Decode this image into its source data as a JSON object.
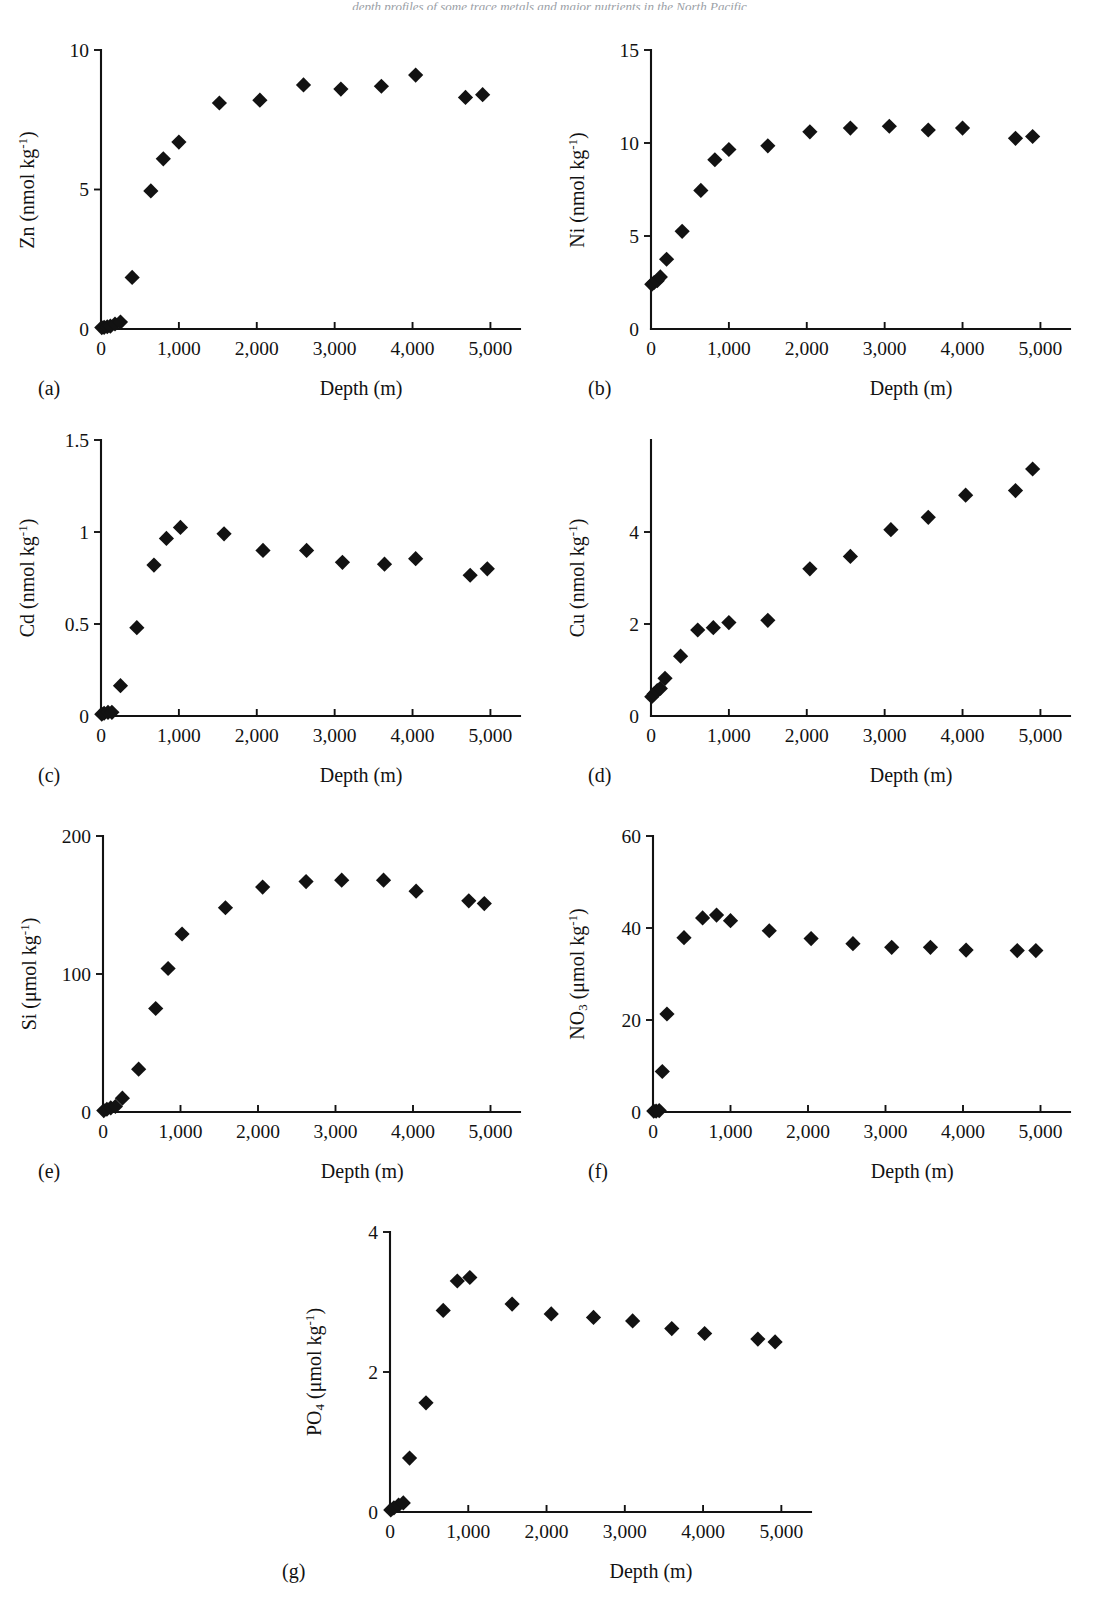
{
  "figure": {
    "page_bleed_text": "depth profiles of some trace metals and major nutrients in the North Pacific",
    "xlabel": "Depth (m)",
    "x_ticks": [
      "0",
      "1,000",
      "2,000",
      "3,000",
      "4,000",
      "5,000"
    ],
    "x_tick_values": [
      0,
      1000,
      2000,
      3000,
      4000,
      5000
    ],
    "marker_style": "filled-diamond",
    "marker_color": "#121212",
    "axis_color": "#121212"
  },
  "chart_data": [
    {
      "type": "scatter",
      "panel": "(a)",
      "title": "",
      "ylabel_plain": "Zn (nmol kg-1)",
      "ylabel_species": "Zn",
      "ylabel_units": "nmol kg",
      "ylabel_exponent": "-1",
      "xlabel": "Depth (m)",
      "xlim": [
        0,
        5200
      ],
      "ylim": [
        0,
        10
      ],
      "y_ticks": [
        "0",
        "5",
        "10"
      ],
      "y_tick_values": [
        0,
        5,
        10
      ],
      "grid": false,
      "legend": "none",
      "x": [
        10,
        40,
        80,
        120,
        180,
        250,
        400,
        640,
        800,
        1000,
        1520,
        2040,
        2600,
        3080,
        3600,
        4040,
        4680,
        4900
      ],
      "y": [
        0.05,
        0.06,
        0.08,
        0.1,
        0.18,
        0.25,
        1.85,
        4.95,
        6.1,
        6.7,
        8.1,
        8.2,
        8.75,
        8.6,
        8.7,
        9.1,
        8.3,
        8.4
      ]
    },
    {
      "type": "scatter",
      "panel": "(b)",
      "title": "",
      "ylabel_plain": "Ni (nmol kg-1)",
      "ylabel_species": "Ni",
      "ylabel_units": "nmol kg",
      "ylabel_exponent": "-1",
      "xlabel": "Depth (m)",
      "xlim": [
        0,
        5200
      ],
      "ylim": [
        0,
        15
      ],
      "y_ticks": [
        "0",
        "5",
        "10",
        "15"
      ],
      "y_tick_values": [
        0,
        5,
        10,
        15
      ],
      "grid": false,
      "legend": "none",
      "x": [
        10,
        40,
        80,
        120,
        200,
        400,
        640,
        820,
        1000,
        1500,
        2040,
        2560,
        3060,
        3560,
        4000,
        4680,
        4900
      ],
      "y": [
        2.4,
        2.5,
        2.6,
        2.8,
        3.75,
        5.25,
        7.45,
        9.1,
        9.65,
        9.85,
        10.6,
        10.8,
        10.9,
        10.7,
        10.8,
        10.25,
        10.35
      ]
    },
    {
      "type": "scatter",
      "panel": "(c)",
      "title": "",
      "ylabel_plain": "Cd (nmol kg-1)",
      "ylabel_species": "Cd",
      "ylabel_units": "nmol kg",
      "ylabel_exponent": "-1",
      "xlabel": "Depth (m)",
      "xlim": [
        0,
        5200
      ],
      "ylim": [
        0,
        1.5
      ],
      "y_ticks": [
        "0",
        "0.5",
        "1",
        "1.5"
      ],
      "y_tick_values": [
        0,
        0.5,
        1,
        1.5
      ],
      "grid": false,
      "legend": "none",
      "x": [
        10,
        40,
        90,
        140,
        250,
        460,
        680,
        840,
        1020,
        1580,
        2080,
        2640,
        3100,
        3640,
        4040,
        4740,
        4960
      ],
      "y": [
        0.01,
        0.015,
        0.02,
        0.02,
        0.165,
        0.48,
        0.82,
        0.965,
        1.025,
        0.99,
        0.9,
        0.9,
        0.835,
        0.825,
        0.855,
        0.765,
        0.8
      ]
    },
    {
      "type": "scatter",
      "panel": "(d)",
      "title": "",
      "ylabel_plain": "Cu (nmol kg-1)",
      "ylabel_species": "Cu",
      "ylabel_units": "nmol kg",
      "ylabel_exponent": "-1",
      "xlabel": "Depth (m)",
      "xlim": [
        0,
        5200
      ],
      "ylim": [
        0,
        6
      ],
      "y_ticks": [
        "0",
        "2",
        "4"
      ],
      "y_tick_values": [
        0,
        2,
        4
      ],
      "grid": false,
      "legend": "none",
      "x": [
        10,
        40,
        80,
        120,
        180,
        380,
        600,
        800,
        1000,
        1500,
        2040,
        2560,
        3080,
        3560,
        4040,
        4680,
        4900
      ],
      "y": [
        0.42,
        0.48,
        0.55,
        0.6,
        0.82,
        1.3,
        1.87,
        1.92,
        2.03,
        2.08,
        3.2,
        3.47,
        4.05,
        4.32,
        4.8,
        4.9,
        5.37
      ]
    },
    {
      "type": "scatter",
      "panel": "(e)",
      "title": "",
      "ylabel_plain": "Si (umol kg-1)",
      "ylabel_species": "Si",
      "ylabel_units": "μmol kg",
      "ylabel_exponent": "-1",
      "xlabel": "Depth (m)",
      "xlim": [
        0,
        5200
      ],
      "ylim": [
        0,
        200
      ],
      "y_ticks": [
        "0",
        "100",
        "200"
      ],
      "y_tick_values": [
        0,
        100,
        200
      ],
      "grid": false,
      "legend": "none",
      "x": [
        10,
        50,
        100,
        160,
        250,
        460,
        680,
        840,
        1020,
        1580,
        2060,
        2620,
        3080,
        3620,
        4040,
        4720,
        4920
      ],
      "y": [
        1,
        2,
        3,
        4,
        10,
        31,
        75,
        104,
        129,
        148,
        163,
        167,
        168,
        168,
        160,
        153,
        151
      ]
    },
    {
      "type": "scatter",
      "panel": "(f)",
      "title": "",
      "ylabel_plain": "NO3 (umol kg-1)",
      "ylabel_species": "NO",
      "ylabel_species_sub": "3",
      "ylabel_units": "μmol kg",
      "ylabel_exponent": "-1",
      "xlabel": "Depth (m)",
      "xlim": [
        0,
        5200
      ],
      "ylim": [
        0,
        60
      ],
      "y_ticks": [
        "0",
        "20",
        "40",
        "60"
      ],
      "y_tick_values": [
        0,
        20,
        40,
        60
      ],
      "grid": false,
      "legend": "none",
      "x": [
        10,
        40,
        80,
        120,
        180,
        400,
        640,
        820,
        1000,
        1500,
        2040,
        2580,
        3080,
        3580,
        4040,
        4700,
        4940
      ],
      "y": [
        0.2,
        0.2,
        0.3,
        8.8,
        21.3,
        37.9,
        42.2,
        42.8,
        41.6,
        39.4,
        37.7,
        36.6,
        35.8,
        35.8,
        35.2,
        35.1,
        35.1
      ]
    },
    {
      "type": "scatter",
      "panel": "(g)",
      "title": "",
      "ylabel_plain": "PO4 (umol kg-1)",
      "ylabel_species": "PO",
      "ylabel_species_sub": "4",
      "ylabel_units": "μmol kg",
      "ylabel_exponent": "-1",
      "xlabel": "Depth (m)",
      "xlim": [
        0,
        5200
      ],
      "ylim": [
        0,
        4
      ],
      "y_ticks": [
        "0",
        "2",
        "4"
      ],
      "y_tick_values": [
        0,
        2,
        4
      ],
      "grid": false,
      "legend": "none",
      "x": [
        10,
        50,
        110,
        170,
        250,
        460,
        680,
        860,
        1020,
        1560,
        2060,
        2600,
        3100,
        3600,
        4020,
        4700,
        4920
      ],
      "y": [
        0.03,
        0.06,
        0.1,
        0.13,
        0.77,
        1.56,
        2.88,
        3.3,
        3.35,
        2.97,
        2.83,
        2.78,
        2.73,
        2.62,
        2.55,
        2.47,
        2.43
      ]
    }
  ]
}
